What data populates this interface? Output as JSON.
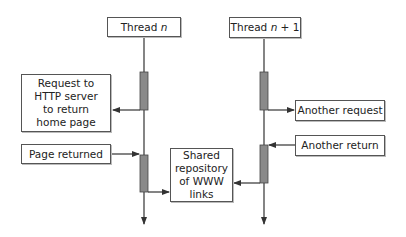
{
  "diagram": {
    "threads": [
      {
        "label_prefix": "Thread ",
        "label_var": "n",
        "label_suffix": ""
      },
      {
        "label_prefix": "Thread ",
        "label_var": "n",
        "label_suffix": " + 1"
      }
    ],
    "left_notes": {
      "request": [
        "Request to",
        "HTTP server",
        "to return",
        "home page"
      ],
      "page_returned": "Page returned"
    },
    "shared_repository": [
      "Shared",
      "repository",
      "of WWW",
      "links"
    ],
    "right_notes": {
      "another_request": "Another request",
      "another_return": "Another return"
    },
    "colors": {
      "line": "#333333",
      "activation_bar": "#8a8a8a",
      "box_border": "#555555"
    }
  }
}
